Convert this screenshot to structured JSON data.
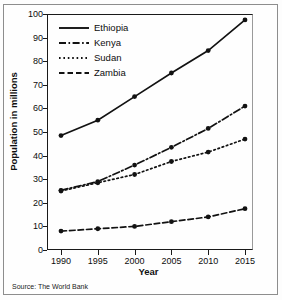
{
  "chart_data": {
    "type": "line",
    "title": "",
    "xlabel": "Year",
    "ylabel": "Population in millions",
    "source": "Source: The World Bank",
    "categories": [
      "1990",
      "1995",
      "2000",
      "2005",
      "2010",
      "2015"
    ],
    "x": [
      1990,
      1995,
      2000,
      2005,
      2010,
      2015
    ],
    "xlim": [
      1990,
      2015
    ],
    "ylim": [
      0,
      100
    ],
    "ytick_labels": [
      "0",
      "10",
      "20",
      "30",
      "40",
      "50",
      "60",
      "70",
      "80",
      "90",
      "100"
    ],
    "yticks": [
      0,
      10,
      20,
      30,
      40,
      50,
      60,
      70,
      80,
      90,
      100
    ],
    "grid": false,
    "legend_position": "top-left",
    "series": [
      {
        "name": "Ethiopia",
        "style": "solid",
        "color": "#121212",
        "values": [
          48.5,
          55,
          65,
          75,
          84.5,
          97.5
        ]
      },
      {
        "name": "Kenya",
        "style": "dash-dot",
        "color": "#121212",
        "values": [
          25.3,
          29,
          36,
          43.5,
          51.5,
          61
        ]
      },
      {
        "name": "Sudan",
        "style": "dotted",
        "color": "#121212",
        "values": [
          25,
          28.5,
          32,
          37.5,
          41.5,
          47
        ]
      },
      {
        "name": "Zambia",
        "style": "dashed",
        "color": "#121212",
        "values": [
          8,
          9,
          10,
          12,
          14,
          17.5
        ]
      }
    ]
  }
}
